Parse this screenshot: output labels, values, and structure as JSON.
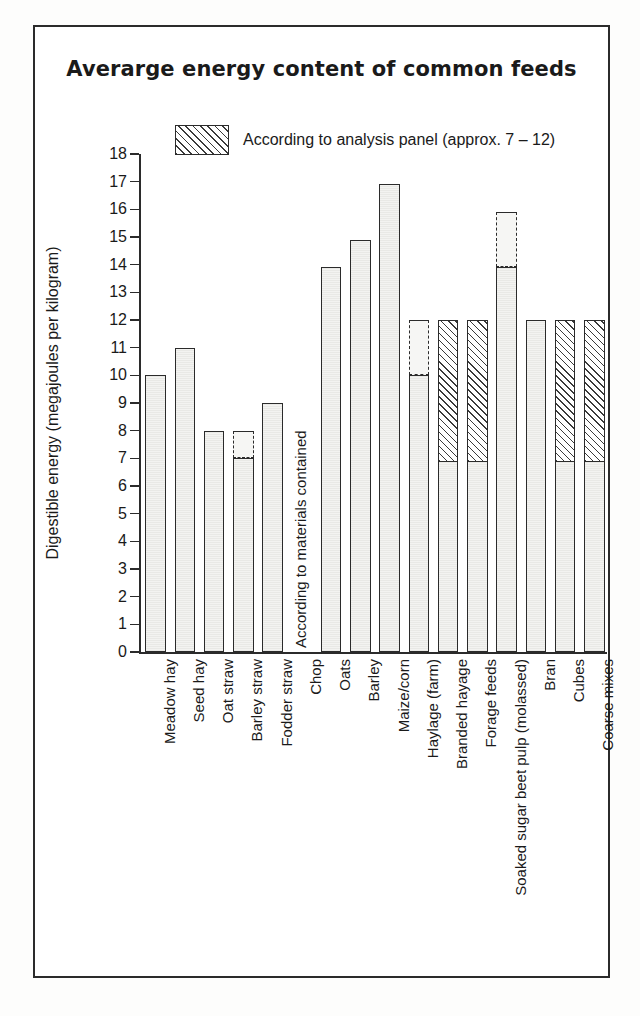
{
  "chart": {
    "title": "Averarge energy content of common feeds",
    "legend": {
      "swatch_name": "hatched-swatch",
      "label": "According to analysis panel (approx. 7 – 12)"
    },
    "chop_note": "According to materials contained"
  },
  "chart_data": {
    "type": "bar",
    "title": "Averarge energy content of common feeds",
    "xlabel": "",
    "ylabel": "Digestible energy (megajoules per kilogram)",
    "ylim": [
      0,
      18
    ],
    "yticks": [
      0,
      1,
      2,
      3,
      4,
      5,
      6,
      7,
      8,
      9,
      10,
      11,
      12,
      13,
      14,
      15,
      16,
      17,
      18
    ],
    "ytick_labels": [
      "0",
      "1",
      "2",
      "3",
      "4",
      "5",
      "6",
      "7",
      "8",
      "9",
      "10",
      "11",
      "12",
      "13",
      "14",
      "15",
      "16",
      "17",
      "18"
    ],
    "grid": false,
    "legend_position": "top-center",
    "legend_entries": [
      "According to analysis panel (approx. 7 – 12)"
    ],
    "annotations": [
      "According to materials contained"
    ],
    "categories": [
      "Meadow hay",
      "Seed hay",
      "Oat straw",
      "Barley straw",
      "Fodder straw",
      "Chop",
      "Oats",
      "Barley",
      "Maize/corn",
      "Haylage (farm)",
      "Branded hayage",
      "Forage feeds",
      "Soaked sugar beet pulp (molassed)",
      "Bran",
      "Cubes",
      "Coarse mixes"
    ],
    "values": [
      10,
      11,
      8,
      8,
      9,
      null,
      13.9,
      14.9,
      16.9,
      12,
      12,
      12,
      15.9,
      12,
      12,
      12
    ],
    "bars": [
      {
        "label": "Meadow hay",
        "value": 10,
        "style": "plain"
      },
      {
        "label": "Seed hay",
        "value": 11,
        "style": "plain"
      },
      {
        "label": "Oat straw",
        "value": 8,
        "style": "plain"
      },
      {
        "label": "Barley straw",
        "value": 8,
        "style": "dashed-top",
        "solid_to": 7,
        "dashed_to": 8
      },
      {
        "label": "Fodder straw",
        "value": 9,
        "style": "plain"
      },
      {
        "label": "Chop",
        "value": null,
        "style": "note"
      },
      {
        "label": "Oats",
        "value": 13.9,
        "style": "plain"
      },
      {
        "label": "Barley",
        "value": 14.9,
        "style": "plain"
      },
      {
        "label": "Maize/corn",
        "value": 16.9,
        "style": "plain"
      },
      {
        "label": "Haylage (farm)",
        "value": 12,
        "style": "dashed-top",
        "solid_to": 10,
        "dashed_to": 12
      },
      {
        "label": "Branded hayage",
        "value": 12,
        "style": "hatched",
        "solid_to": 6.9,
        "hatch_from": 6.9,
        "hatch_to": 12
      },
      {
        "label": "Forage feeds",
        "value": 12,
        "style": "hatched",
        "solid_to": 6.9,
        "hatch_from": 6.9,
        "hatch_to": 12
      },
      {
        "label": "Soaked sugar beet pulp (molassed)",
        "value": 15.9,
        "style": "dashed-top",
        "solid_to": 13.9,
        "dashed_to": 15.9
      },
      {
        "label": "Bran",
        "value": 12,
        "style": "plain"
      },
      {
        "label": "Cubes",
        "value": 12,
        "style": "hatched",
        "solid_to": 6.9,
        "hatch_from": 6.9,
        "hatch_to": 12
      },
      {
        "label": "Coarse mixes",
        "value": 12,
        "style": "hatched",
        "solid_to": 6.9,
        "hatch_from": 6.9,
        "hatch_to": 12
      }
    ]
  },
  "colors": {
    "ink": "#2b2b2b",
    "bar_fill": "#eeeeec",
    "hatch": "#3a3a3a",
    "background": "#ffffff"
  }
}
